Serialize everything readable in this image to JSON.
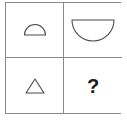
{
  "puzzle": {
    "type": "visual-analogy-matrix",
    "rows": 2,
    "columns": 2,
    "border_color": "#8a8a8a",
    "cell_background": "#ffffff",
    "stroke_color": "#4a4a4a",
    "cells": [
      {
        "position": "top-left",
        "row": 0,
        "column": 0,
        "icon_name": "small-semicircle-flat-bottom",
        "shape": "semicircle",
        "orientation": "flat-side-down",
        "size": "small",
        "width_px": 22,
        "height_px": 11,
        "label": ""
      },
      {
        "position": "top-right",
        "row": 0,
        "column": 1,
        "icon_name": "large-semicircle-flat-top",
        "shape": "semicircle",
        "orientation": "flat-side-up",
        "size": "large",
        "width_px": 42,
        "height_px": 21,
        "label": ""
      },
      {
        "position": "bottom-left",
        "row": 1,
        "column": 0,
        "icon_name": "small-triangle-up",
        "shape": "triangle",
        "orientation": "point-up",
        "size": "small",
        "width_px": 19,
        "height_px": 15,
        "label": ""
      },
      {
        "position": "bottom-right",
        "row": 1,
        "column": 1,
        "icon_name": "question-mark",
        "shape": "text",
        "orientation": "",
        "size": "",
        "label": "?"
      }
    ]
  }
}
